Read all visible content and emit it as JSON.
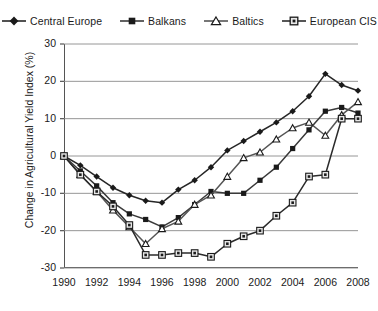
{
  "chart_data": {
    "type": "line",
    "title": "",
    "xlabel": "",
    "ylabel": "Change in Agricultural Yield Index (%)",
    "xlim": [
      1990,
      2008
    ],
    "ylim": [
      -30,
      30
    ],
    "yticks": [
      30,
      20,
      10,
      0,
      -10,
      -20,
      -30
    ],
    "ytick_labels": [
      "30",
      "20",
      "10",
      "0",
      "-10",
      "-20",
      "-30"
    ],
    "xticks": [
      1990,
      1992,
      1994,
      1996,
      1998,
      2000,
      2002,
      2004,
      2006,
      2008
    ],
    "xtick_labels": [
      "1990",
      "1992",
      "1994",
      "1996",
      "1998",
      "2000",
      "2002",
      "2004",
      "2006",
      "2008"
    ],
    "x": [
      1990,
      1991,
      1992,
      1993,
      1994,
      1995,
      1996,
      1997,
      1998,
      1999,
      2000,
      2001,
      2002,
      2003,
      2004,
      2005,
      2006,
      2007,
      2008
    ],
    "grid": "horizontal",
    "legend_position": "top",
    "series": [
      {
        "name": "Central Europe",
        "marker": "filled-diamond",
        "color": "#262626",
        "values": [
          0,
          -2.5,
          -5.5,
          -8.5,
          -10.5,
          -12,
          -12.5,
          -9,
          -6.5,
          -3,
          1.5,
          4,
          6.5,
          9,
          12,
          16,
          22,
          19,
          17.5
        ]
      },
      {
        "name": "Balkans",
        "marker": "filled-square",
        "color": "#3a3a3a",
        "values": [
          0,
          -4,
          -8,
          -12.5,
          -15.5,
          -17,
          -19,
          -16.5,
          -13,
          -9.5,
          -10,
          -10,
          -6.5,
          -3,
          2,
          7,
          12,
          13,
          11.5
        ]
      },
      {
        "name": "Baltics",
        "marker": "open-triangle",
        "color": "#555555",
        "values": [
          0,
          -5,
          -9.5,
          -14.5,
          -19,
          -23.5,
          -19.5,
          -17.5,
          -13,
          -10.5,
          -5.5,
          -0.5,
          1,
          4.5,
          7.5,
          9,
          5.5,
          11,
          14.5
        ]
      },
      {
        "name": "European CIS",
        "marker": "square-dot",
        "color": "#2b2b2b",
        "values": [
          0,
          -5,
          -9.5,
          -13.5,
          -18.5,
          -26.5,
          -26.5,
          -26,
          -26,
          -27,
          -23.5,
          -21.5,
          -20,
          -16,
          -12.5,
          -5.5,
          -5,
          10,
          10
        ]
      }
    ]
  },
  "legend": {
    "items": [
      {
        "label": "Central Europe",
        "marker": "filled-diamond"
      },
      {
        "label": "Balkans",
        "marker": "filled-square"
      },
      {
        "label": "Baltics",
        "marker": "open-triangle"
      },
      {
        "label": "European CIS",
        "marker": "square-dot"
      }
    ]
  }
}
